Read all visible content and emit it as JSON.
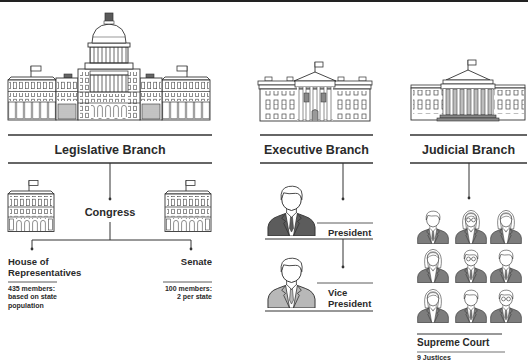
{
  "colors": {
    "line": "#333333",
    "top_bar": "#222222",
    "president_suit": "#5c5c5c",
    "vice_president_suit": "#b8b8b8",
    "justice_suit": "#7d7d7d",
    "text": "#2a2a2a"
  },
  "branches": {
    "legislative": {
      "title": "Legislative Branch",
      "icon": "capitol-building-icon",
      "body": "Congress",
      "chambers": [
        {
          "name_lines": [
            "House of",
            "Representatives"
          ],
          "icon": "house-building-icon",
          "detail_lines": [
            "435 members:",
            "based on state",
            "population"
          ]
        },
        {
          "name_lines": [
            "Senate"
          ],
          "icon": "senate-building-icon",
          "detail_lines": [
            "100 members:",
            "2 per state"
          ]
        }
      ]
    },
    "executive": {
      "title": "Executive Branch",
      "icon": "white-house-icon",
      "offices": [
        {
          "label_lines": [
            "President"
          ],
          "icon": "president-person-icon"
        },
        {
          "label_lines": [
            "Vice",
            "President"
          ],
          "icon": "vice-president-person-icon"
        }
      ]
    },
    "judicial": {
      "title": "Judicial Branch",
      "icon": "supreme-court-building-icon",
      "body": "Supreme Court",
      "detail": "9 Justices",
      "justices_count": 9,
      "justice_icons": [
        "justice-male-icon",
        "justice-female-glasses-icon",
        "justice-female-icon",
        "justice-female-long-hair-icon",
        "justice-male-glasses-icon",
        "justice-male-icon",
        "justice-female-long-hair-icon",
        "justice-male-icon",
        "justice-male-glasses-icon"
      ]
    }
  }
}
